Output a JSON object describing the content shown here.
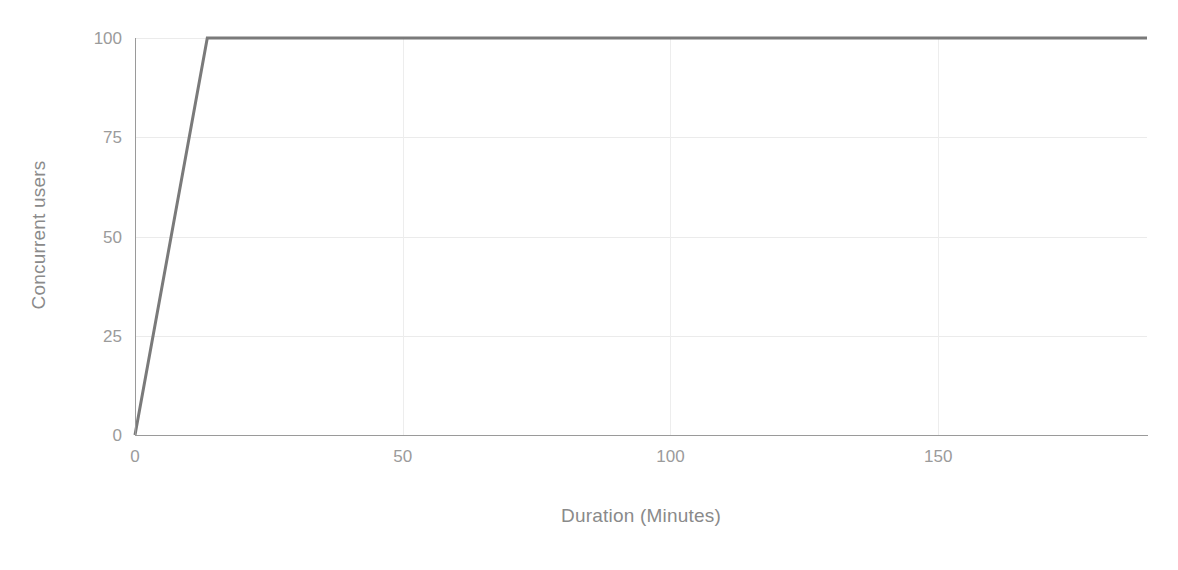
{
  "chart_data": {
    "type": "line",
    "title": "",
    "xlabel": "Duration (Minutes)",
    "ylabel": "Concurrent users",
    "xlim": [
      0,
      189
    ],
    "ylim": [
      0,
      100
    ],
    "xticks": [
      0,
      50,
      100,
      150
    ],
    "xtick_labels": [
      "0",
      "50",
      "100",
      "150"
    ],
    "yticks": [
      0,
      25,
      50,
      75,
      100
    ],
    "ytick_labels": [
      "0",
      "25",
      "50",
      "75",
      "100"
    ],
    "grid": true,
    "grid_axis": "both",
    "legend": false,
    "legend_position": "none",
    "line_color": "#7a7a7a",
    "line_width": 3,
    "grid_color": "#ebebeb",
    "axis_color": "#9a9a9a",
    "text_color": "#9b9b9b",
    "background_color": "#ffffff",
    "series": [
      {
        "name": "Concurrent users",
        "x": [
          0,
          13.5,
          189
        ],
        "values": [
          0,
          100,
          100
        ],
        "description": "Ramp-up from 0 to 100 concurrent users over the first ~13.5 minutes, then a steady plateau at 100 users through minute 189."
      }
    ]
  },
  "axis": {
    "y_title": "Concurrent users",
    "x_title": "Duration (Minutes)"
  }
}
